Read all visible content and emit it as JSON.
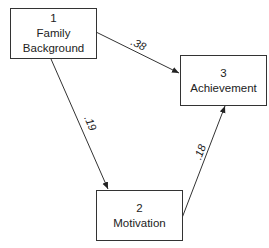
{
  "nodes": [
    {
      "id": "1",
      "number": "1",
      "line1": "Family",
      "line2": "Background"
    },
    {
      "id": "2",
      "number": "2",
      "line1": "Motivation"
    },
    {
      "id": "3",
      "number": "3",
      "line1": "Achievement"
    }
  ],
  "edges": [
    {
      "from": "1",
      "to": "3",
      "coefficient": ".38"
    },
    {
      "from": "1",
      "to": "2",
      "coefficient": ".19"
    },
    {
      "from": "2",
      "to": "3",
      "coefficient": ".18"
    }
  ]
}
